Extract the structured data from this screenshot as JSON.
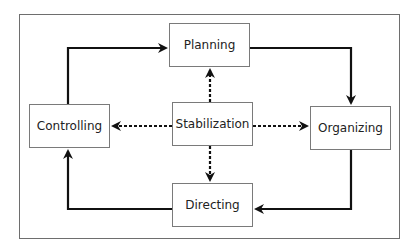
{
  "diagram": {
    "nodes": [
      {
        "id": "planning",
        "label": "Planning"
      },
      {
        "id": "organizing",
        "label": "Organizing"
      },
      {
        "id": "directing",
        "label": "Directing"
      },
      {
        "id": "controlling",
        "label": "Controlling"
      },
      {
        "id": "stabilization",
        "label": "Stabilization"
      }
    ],
    "edges": [
      {
        "from": "planning",
        "to": "organizing",
        "style": "solid"
      },
      {
        "from": "organizing",
        "to": "directing",
        "style": "solid"
      },
      {
        "from": "directing",
        "to": "controlling",
        "style": "solid"
      },
      {
        "from": "controlling",
        "to": "planning",
        "style": "solid"
      },
      {
        "from": "stabilization",
        "to": "planning",
        "style": "dashed"
      },
      {
        "from": "stabilization",
        "to": "organizing",
        "style": "dashed"
      },
      {
        "from": "stabilization",
        "to": "directing",
        "style": "dashed"
      },
      {
        "from": "stabilization",
        "to": "controlling",
        "style": "dashed"
      }
    ],
    "colors": {
      "line": "#111111",
      "border": "#7a7a7a",
      "frame": "#6e6e6e"
    }
  }
}
